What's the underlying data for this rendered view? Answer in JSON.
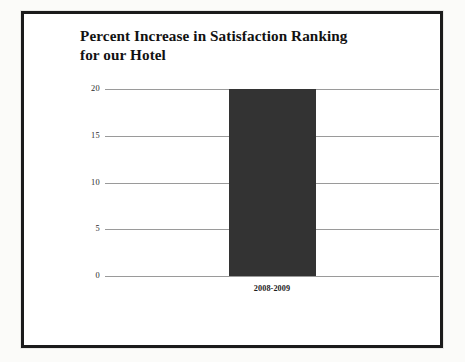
{
  "slide": {
    "title_line1": "Percent Increase in Satisfaction Ranking",
    "title_line2": "for our Hotel",
    "title_full": "Percent Increase in Satisfaction Ranking\nfor our Hotel",
    "frame_color": "#1b1b1b",
    "background_color": "#ffffff",
    "page_background_color": "#fbfbf9"
  },
  "chart_data": {
    "type": "bar",
    "title": "Percent Increase in Satisfaction Ranking for our Hotel",
    "categories": [
      "2008-2009"
    ],
    "values": [
      20
    ],
    "series": [
      {
        "name": "Percent Increase",
        "values": [
          20
        ]
      }
    ],
    "xlabel": "",
    "ylabel": "",
    "ylim": [
      0,
      20
    ],
    "yticks": [
      0,
      5,
      10,
      15,
      20
    ],
    "ytick_labels": [
      "0",
      "5",
      "10",
      "15",
      "20"
    ],
    "grid": true,
    "grid_axis": "y",
    "grid_color": "#9a9a9a",
    "legend": false,
    "legend_position": "none",
    "bar_color": "#333333",
    "bar_count": 1,
    "annotations": []
  }
}
